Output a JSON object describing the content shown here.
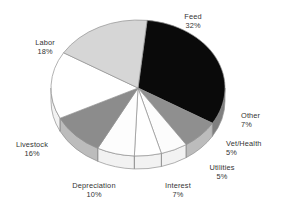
{
  "chart_data": {
    "type": "pie",
    "title": "",
    "subtitle": "",
    "xlabel": "",
    "ylabel": "",
    "grid": false,
    "legend_position": "none",
    "style": "3d-pie-with-side-wall",
    "value_unit": "percent",
    "total": 100,
    "categories": [
      "Feed",
      "Other",
      "Vet/Health",
      "Utilities",
      "Interest",
      "Depreciation",
      "Livestock",
      "Labor"
    ],
    "values": [
      32,
      7,
      5,
      5,
      7,
      10,
      16,
      18
    ],
    "labels": [
      "Feed 32%",
      "Other 7%",
      "Vet/Health 5%",
      "Utilities 5%",
      "Interest 7%",
      "Depreciation 10%",
      "Livestock 16%",
      "Labor 18%"
    ],
    "slices": [
      {
        "name": "Feed",
        "value": 32,
        "pct_text": "32%",
        "fill": "#0a0a0a",
        "label_align": "center",
        "label_x": 193,
        "label_y": 12
      },
      {
        "name": "Other",
        "value": 7,
        "pct_text": "7%",
        "fill": "#8f8f8f",
        "label_align": "left",
        "label_x": 241,
        "label_y": 111
      },
      {
        "name": "Vet/Health",
        "value": 5,
        "pct_text": "5%",
        "fill": "#fcfcfc",
        "label_align": "left",
        "label_x": 226,
        "label_y": 139
      },
      {
        "name": "Utilities",
        "value": 5,
        "pct_text": "5%",
        "fill": "#ffffff",
        "label_align": "center",
        "label_x": 222,
        "label_y": 163
      },
      {
        "name": "Interest",
        "value": 7,
        "pct_text": "7%",
        "fill": "#fdfdfd",
        "label_align": "center",
        "label_x": 178,
        "label_y": 181
      },
      {
        "name": "Depreciation",
        "value": 10,
        "pct_text": "10%",
        "fill": "#8c8c8c",
        "label_align": "center",
        "label_x": 94,
        "label_y": 181
      },
      {
        "name": "Livestock",
        "value": 16,
        "pct_text": "16%",
        "fill": "#ffffff",
        "label_align": "center",
        "label_x": 32,
        "label_y": 140
      },
      {
        "name": "Labor",
        "value": 18,
        "pct_text": "18%",
        "fill": "#d6d6d6",
        "label_align": "center",
        "label_x": 45,
        "label_y": 38
      }
    ],
    "colors": {
      "feed": "#0a0a0a",
      "other": "#8f8f8f",
      "vet_health": "#fcfcfc",
      "utilities": "#ffffff",
      "interest": "#fdfdfd",
      "depreciation": "#8c8c8c",
      "livestock": "#ffffff",
      "labor": "#d6d6d6",
      "outline": "#909090",
      "wall_light": "#f2f2f2",
      "wall_mid": "#bcbcbc",
      "wall_dark": "#7f7f7f",
      "background": "#ffffff",
      "text": "#333333"
    },
    "geometry": {
      "center_x": 138,
      "center_y": 88,
      "radius_x": 87,
      "radius_y": 68,
      "depth": 13,
      "start_angle_deg": -84
    }
  }
}
